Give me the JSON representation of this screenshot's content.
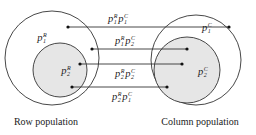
{
  "diagram": {
    "colors": {
      "stroke": "#333333",
      "inner_fill": "#e6e6e6",
      "background": "#ffffff"
    },
    "row_population": {
      "caption": "Row population",
      "outer_label": {
        "base": "p",
        "sub": "1",
        "sup": "R"
      },
      "inner_label": {
        "base": "p",
        "sub": "2",
        "sup": "R"
      }
    },
    "column_population": {
      "caption": "Column population",
      "outer_label": {
        "base": "p",
        "sub": "1",
        "sup": "C"
      },
      "inner_label": {
        "base": "p",
        "sub": "2",
        "sup": "C"
      }
    },
    "connections": [
      {
        "label": [
          {
            "base": "p",
            "sub": "1",
            "sup": "R"
          },
          {
            "base": "p",
            "sub": "1",
            "sup": "C"
          }
        ]
      },
      {
        "label": [
          {
            "base": "p",
            "sub": "1",
            "sup": "R"
          },
          {
            "base": "p",
            "sub": "2",
            "sup": "C"
          }
        ]
      },
      {
        "label": [
          {
            "base": "p",
            "sub": "2",
            "sup": "R"
          },
          {
            "base": "p",
            "sub": "2",
            "sup": "C"
          }
        ]
      },
      {
        "label": [
          {
            "base": "p",
            "sub": "2",
            "sup": "R"
          },
          {
            "base": "p",
            "sub": "1",
            "sup": "C"
          }
        ]
      }
    ]
  }
}
